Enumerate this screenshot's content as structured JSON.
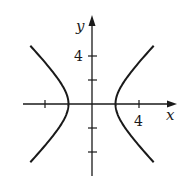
{
  "chart_data": {
    "type": "line",
    "title": "",
    "xlabel": "x",
    "ylabel": "y",
    "equation": "x^2/4 - y^2/4 = 1",
    "xlim": [
      -7.5,
      7.2
    ],
    "ylim": [
      -6,
      7.3
    ],
    "x_ticks": [
      -4,
      4
    ],
    "x_tick_labels": [
      "",
      "4"
    ],
    "y_ticks": [
      -4,
      -2,
      2,
      4
    ],
    "y_tick_labels": [
      "",
      "",
      "",
      "4"
    ],
    "grid": false,
    "series": [
      {
        "name": "right branch",
        "vertex": [
          2,
          0
        ],
        "x_range": [
          2,
          5.87
        ]
      },
      {
        "name": "left branch",
        "vertex": [
          -2,
          0
        ],
        "x_range": [
          -5.87,
          -2
        ]
      }
    ],
    "line_color": "#1a1a1a"
  },
  "labels": {
    "x_axis": "x",
    "y_axis": "y",
    "x_tick_4": "4",
    "y_tick_4": "4"
  }
}
